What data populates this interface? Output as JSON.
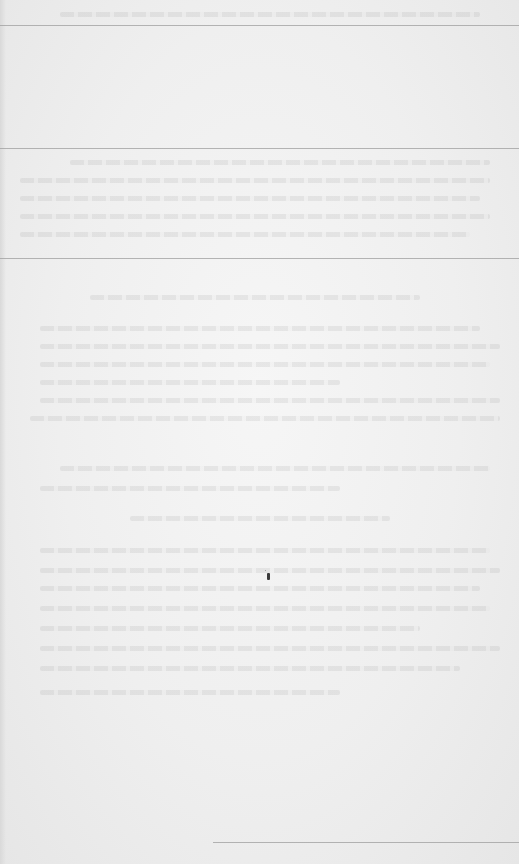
{
  "document": {
    "type": "scanned-page",
    "legible_text": [],
    "rules": [
      {
        "id": "top-rule",
        "x": 0,
        "y": 25,
        "width": 519
      },
      {
        "id": "section-rule-1",
        "x": 0,
        "y": 148,
        "width": 519
      },
      {
        "id": "section-rule-2",
        "x": 0,
        "y": 258,
        "width": 519
      },
      {
        "id": "footnote-rule",
        "x": 213,
        "y": 842,
        "width": 306
      }
    ],
    "colors": {
      "paper": "#efefef",
      "rule": "#9e9e9e",
      "speck": "#3a3a3a"
    }
  }
}
